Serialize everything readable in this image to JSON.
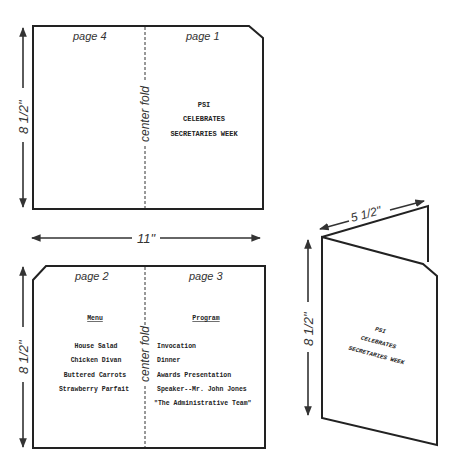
{
  "dimensions": {
    "height": "8 1/2\"",
    "width": "11\"",
    "folded_width": "5 1/2\""
  },
  "fold_label": "center fold",
  "outside_sheet": {
    "left_page": {
      "label": "page 4"
    },
    "right_page": {
      "label": "page 1",
      "lines": [
        "PSI",
        "CELEBRATES",
        "SECRETARIES WEEK"
      ]
    }
  },
  "inside_sheet": {
    "left_page": {
      "label": "page 2",
      "heading": "Menu",
      "items": [
        "House Salad",
        "Chicken Divan",
        "Buttered Carrots",
        "Strawberry Parfait"
      ]
    },
    "right_page": {
      "label": "page 3",
      "heading": "Program",
      "items": [
        "Invocation",
        "Dinner",
        "Awards Presentation",
        "Speaker--Mr. John Jones",
        "\"The Administrative Team\""
      ]
    }
  },
  "folded_booklet": {
    "lines": [
      "PSI",
      "CELEBRATES",
      "SECRETARIES WEEK"
    ]
  },
  "colors": {
    "ink": "#222222",
    "background": "#ffffff"
  }
}
